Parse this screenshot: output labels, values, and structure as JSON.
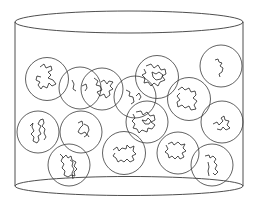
{
  "diagram": {
    "stroke_color": "#3a3a3a",
    "background": "#ffffff",
    "container": {
      "type": "cylinder",
      "cx": 129,
      "top_cy": 22,
      "bottom_cy": 186,
      "rx": 114,
      "top_ry": 11,
      "bottom_ry": 9.5
    },
    "coils": [
      {
        "cx": 47,
        "cy": 79,
        "r": 21.5,
        "path": "M40 67 l4 -3 l2 4 l5 -2 l1 4 l-4 2 l3 3 l-3 3 l5 2 l3 4 l-4 2 l-3 -3 l-2 5 l-4 -2 l-2 3 l-3 -4 l2 -3 l-4 -2 l1 -4 l4 1"
      },
      {
        "cx": 80,
        "cy": 88,
        "r": 21,
        "path": "M72 80 l2 4 l-1 5 l3 2 M82 86 l4 -2 l1 4 l-2 3"
      },
      {
        "cx": 102,
        "cy": 89,
        "r": 21,
        "path": "M94 78 l4 3 l-2 4 l4 1 l2 4 l-5 2 l3 4 l4 -2 l2 4 l4 -3 l-1 -4 l4 -2 l-3 -3 l3 -4 l-4 -1 l-2 3 l-3 -4 l-3 2"
      },
      {
        "cx": 135,
        "cy": 97,
        "r": 21,
        "path": "M126 90 l4 2 l-1 4 l4 1 l1 5 l-3 2 M136 96 l3 -3 l2 4 l-2 3"
      },
      {
        "cx": 157,
        "cy": 77,
        "r": 21.5,
        "path": "M146 66 l5 -2 l3 4 l4 -3 l3 5 l4 -1 l1 5 l-4 2 l3 4 l-5 2 l-2 4 l-4 -3 l-3 3 l-3 -4 l-4 1 l1 -5 l-3 -3 l4 -2 l-2 -4 M152 72 l4 2 l3 -2 l4 3 l-2 4 l-5 1 l-3 -3 z"
      },
      {
        "cx": 221,
        "cy": 66,
        "r": 21,
        "path": "M215 60 l3 -1 l1 3 l3 1 l-2 3 l3 2 l-1 4 l-3 2 l1 3"
      },
      {
        "cx": 189,
        "cy": 99,
        "r": 21.5,
        "path": "M178 90 l4 -3 l3 3 l4 -2 l2 4 l4 -1 l1 4 l-3 3 l4 3 l-3 4 l2 4 l-5 1 l-2 -4 l-4 2 l-3 -3 l-4 2 l-1 -5 l3 -2 l-3 -4 l3 -3"
      },
      {
        "cx": 147,
        "cy": 122,
        "r": 21,
        "path": "M136 112 l5 -1 l2 4 l4 -3 l3 4 l4 -1 l1 5 l-4 2 l4 3 l-3 4 l-4 -1 l-1 4 l-5 -2 l-3 3 l-2 -4 l-4 -1 l2 -4 l-3 -3 l3 -3 l-2 -4 M142 120 l4 1 l2 -3 l3 3 l-2 3 l-4 0 z"
      },
      {
        "cx": 222,
        "cy": 122,
        "r": 21,
        "path": "M213 124 l4 -2 l2 3 l4 -4 l-2 -3 l3 -2 l1 4 l4 1 l-2 4 l3 3 l-4 2 l-3 -3 l-2 3 l-4 -1"
      },
      {
        "cx": 38,
        "cy": 132,
        "r": 21,
        "path": "M30 126 l3 -3 l-1 4 l2 4 l-3 3 l3 3 l-1 4 l4 2 l2 -3 l-1 -4 l3 -2 l-2 -4 l2 -4 l-3 -2 l2 -4 l3 -1 l1 4 l-2 3 l3 3 l-1 4 l2 4 l-2 3"
      },
      {
        "cx": 81,
        "cy": 132,
        "r": 21,
        "path": "M78 123 l4 -2 l1 4 l-3 3 l-2 4 l3 2 l4 -2 l2 3 l-3 2 M84 124 l4 2 l1 4 l-2 4 l2 3"
      },
      {
        "cx": 69,
        "cy": 165,
        "r": 21,
        "path": "M60 154 l3 3 l-2 4 l3 3 l-2 4 l3 3 l-1 4 l4 2 l3 -2 l4 1 l-1 -4 l3 -3 l-3 -3 l2 -4 l-4 -2 l-1 -4 l-3 2 l-2 -3 l-3 3 M70 160 l3 2 l-1 4 l2 3 l-2 4 l1 6"
      },
      {
        "cx": 124,
        "cy": 153,
        "r": 21.5,
        "path": "M113 150 l4 -3 l2 4 l3 -3 l4 1 l1 -4 l3 3 l4 -2 l-1 5 l3 3 l-4 2 l2 4 l-4 2 l-3 -3 l-3 3 l-3 -2 l-3 2 l-2 -4 l-3 -2 l2 -3"
      },
      {
        "cx": 178,
        "cy": 153,
        "r": 21,
        "path": "M168 144 l4 -2 l2 3 l4 -3 l3 3 l4 -1 l-2 4 l3 3 l-4 2 l2 4 l-4 2 l-2 -3 l-3 3 l-3 -3 l-3 2 l-1 -4 l-3 -2 l3 -3 l-2 -4"
      },
      {
        "cx": 212,
        "cy": 165,
        "r": 21,
        "path": "M205 156 l4 -1 l1 3 l3 -2 l3 3 l-2 3 l3 3 l-2 4 l3 3 l-3 3 l-2 -2 M208 162 l1 5 l-1 4 l1 5"
      }
    ]
  }
}
